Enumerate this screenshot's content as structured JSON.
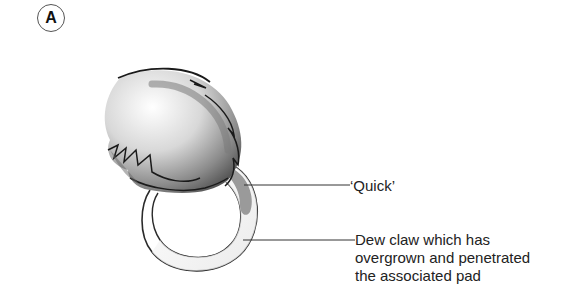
{
  "figure": {
    "panel_label": "A",
    "labels": {
      "quick": "‘Quick’",
      "dew_claw_line1": "Dew claw which has",
      "dew_claw_line2": "overgrown and penetrated",
      "dew_claw_line3": "the associated pad"
    },
    "colors": {
      "outline": "#222222",
      "pad_shade": "#888888",
      "quick_fill": "#9a9a9a",
      "claw_fill": "#f2f2f2"
    }
  }
}
